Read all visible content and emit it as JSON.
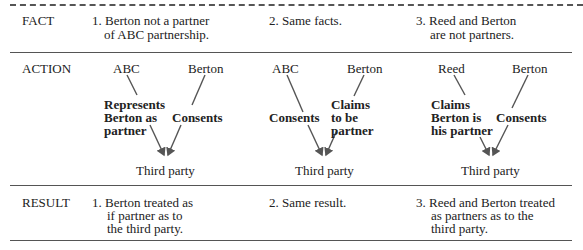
{
  "rows": {
    "fact": {
      "label": "FACT",
      "cells": [
        {
          "line1": "1. Berton not a partner",
          "line2": "of ABC partnership."
        },
        {
          "line1": "2. Same facts."
        },
        {
          "line1": "3. Reed and Berton",
          "line2": "are not partners."
        }
      ]
    },
    "action": {
      "label": "ACTION",
      "cells": [
        {
          "left_party": "ABC",
          "right_party": "Berton",
          "left_action": [
            "Represents",
            "Berton as",
            "partner"
          ],
          "right_action": [
            "Consents"
          ],
          "target": "Third party"
        },
        {
          "left_party": "ABC",
          "right_party": "Berton",
          "left_action": [
            "Consents"
          ],
          "right_action": [
            "Claims",
            "to be",
            "partner"
          ],
          "target": "Third party"
        },
        {
          "left_party": "Reed",
          "right_party": "Berton",
          "left_action": [
            "Claims",
            "Berton is",
            "his partner"
          ],
          "right_action": [
            "Consents"
          ],
          "target": "Third party"
        }
      ]
    },
    "result": {
      "label": "RESULT",
      "cells": [
        {
          "line1": "1. Berton treated as",
          "line2": "if partner as to",
          "line3": "the third party."
        },
        {
          "line1": "2. Same result."
        },
        {
          "line1": "3. Reed and Berton treated",
          "line2": "as partners as to the",
          "line3": "third party."
        }
      ]
    }
  },
  "colors": {
    "text": "#222222",
    "rule": "#555555",
    "background": "#ffffff"
  }
}
